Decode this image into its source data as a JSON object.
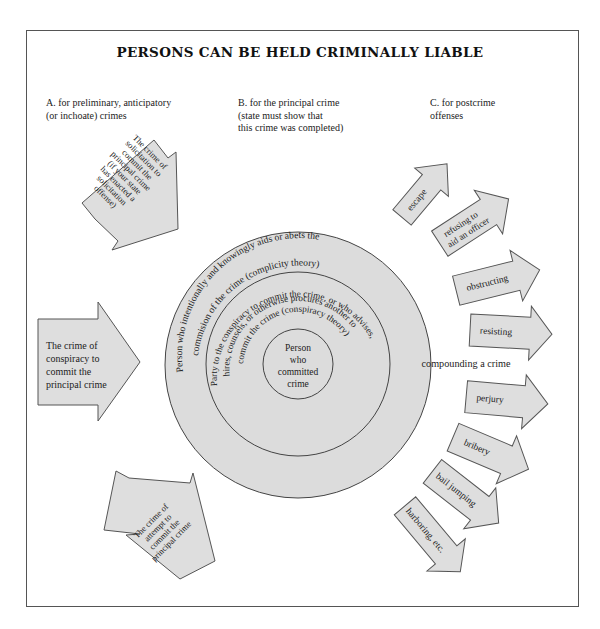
{
  "title": "PERSONS CAN BE HELD CRIMINALLY LIABLE",
  "columns": {
    "a": {
      "line1": "A. for preliminary, anticipatory",
      "line2": "(or inchoate) crimes"
    },
    "b": {
      "line1": "B. for the principal crime",
      "line2": "(state must show that",
      "line3": "this crime was completed)"
    },
    "c": {
      "line1": "C. for postcrime",
      "line2": "offenses"
    }
  },
  "inchoate_arrows": {
    "solicitation": [
      "The crime of",
      "solicitation to",
      "commit the",
      "principal crime",
      "(if your state",
      "has enacted a",
      "solicitation",
      "offense)"
    ],
    "conspiracy": [
      "The crime of",
      "conspiracy to",
      "commit the",
      "principal crime"
    ],
    "attempt": [
      "The crime of",
      "attempt to",
      "commit the",
      "principal crime"
    ]
  },
  "circles": {
    "outer": {
      "arc1": "Person who intentionally and knowingly aids or abets the",
      "arc2": "commision of the crime (complicity theory)"
    },
    "middle": {
      "arc1": "Party to the conspiracy to commit the crime, or who advises,",
      "arc2": "hires, counsels, or otherwise procures another to",
      "arc3": "commit the crime (conspiracy theory)"
    },
    "inner": [
      "Person",
      "who",
      "committed",
      "crime"
    ]
  },
  "postcrime_arrows": {
    "escape": "escape",
    "refusing": [
      "refusing to",
      "aid an officer"
    ],
    "obstructing": "obstructing",
    "resisting": "resisting",
    "compounding": "compounding a crime",
    "perjury": "perjury",
    "bribery": "bribery",
    "bail_jumping": "bail jumping",
    "harboring": "harboring, etc."
  },
  "colors": {
    "fill": "#dedede",
    "stroke": "#555555",
    "text": "#222222"
  }
}
